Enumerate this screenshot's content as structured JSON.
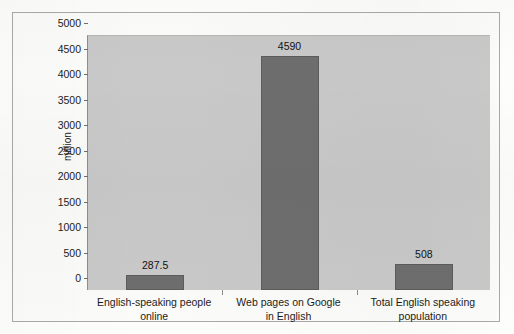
{
  "chart_data": {
    "type": "bar",
    "title": "",
    "xlabel": "",
    "ylabel": "million",
    "ylim": [
      0,
      5000
    ],
    "ytick_step": 500,
    "yticks": [
      5000,
      4500,
      4000,
      3500,
      3000,
      2500,
      2000,
      1500,
      1000,
      500,
      0
    ],
    "ytick_labels": [
      "5000",
      "4500",
      "4000",
      "3500",
      "3000",
      "2500",
      "2000",
      "1500",
      "1000",
      "500",
      "0"
    ],
    "categories": [
      "English-speaking people online",
      "Web pages on Google in English",
      "Total English speaking population"
    ],
    "category_lines": [
      [
        "English-speaking people",
        "online"
      ],
      [
        "Web pages on Google",
        "in English"
      ],
      [
        "Total English speaking",
        "population"
      ]
    ],
    "values": [
      287.5,
      4590,
      508
    ],
    "value_labels": [
      "287.5",
      "4590",
      "508"
    ],
    "grid": false,
    "legend": null,
    "colors": {
      "bar_fill": "#6e6e6e",
      "bar_stroke": "#5c5c5c",
      "plot_background": "#c9c9c9",
      "page_background": "#fdfdfb",
      "frame_border": "#a9a9a9",
      "text": "#1b1b1b"
    }
  }
}
